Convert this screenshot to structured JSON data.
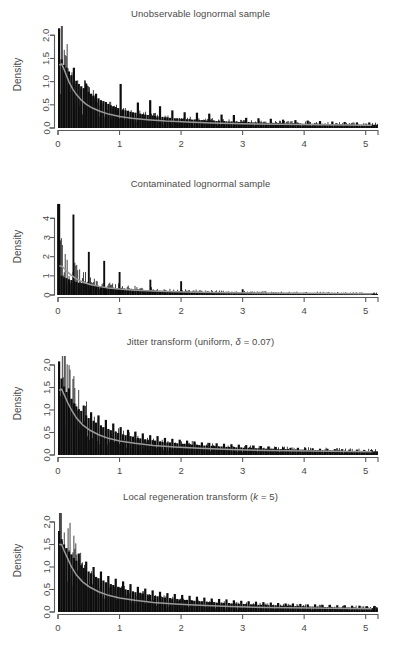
{
  "figure": {
    "width": 401,
    "height": 650,
    "background": "#ffffff",
    "axis_color": "#5a5a5a",
    "hist_color": "#0d0d0d",
    "density_color": "#9a9a9a",
    "text_color": "#494949"
  },
  "chart_data": [
    {
      "type": "bar",
      "title": "Unobservable lognormal sample",
      "xlabel": "",
      "ylabel": "Density",
      "xlim": [
        0,
        5.2
      ],
      "ylim": [
        0,
        2.2
      ],
      "xticks": [
        0,
        1,
        2,
        3,
        4,
        5
      ],
      "xticklabels": [
        "0",
        "1",
        "2",
        "3",
        "4",
        "5"
      ],
      "yticks": [
        0.0,
        0.5,
        1.0,
        1.5,
        2.0
      ],
      "yticklabels": [
        "0.0",
        "0.5",
        "1.0",
        "1.5",
        "2.0"
      ],
      "grid": false,
      "legend": "none",
      "bin_width": 0.04,
      "values": [
        2.15,
        1.48,
        1.36,
        1.3,
        1.22,
        1.14,
        1.3,
        1.02,
        0.95,
        0.9,
        0.86,
        0.96,
        0.78,
        0.74,
        0.7,
        0.74,
        0.64,
        0.6,
        0.58,
        0.56,
        0.52,
        0.49,
        0.47,
        0.45,
        0.43,
        0.95,
        0.4,
        0.38,
        0.37,
        0.35,
        0.34,
        0.33,
        0.55,
        0.31,
        0.3,
        0.29,
        0.28,
        0.6,
        0.27,
        0.26,
        0.25,
        0.47,
        0.24,
        0.23,
        0.23,
        0.22,
        0.38,
        0.21,
        0.21,
        0.2,
        0.2,
        0.34,
        0.19,
        0.19,
        0.18,
        0.18,
        0.33,
        0.17,
        0.17,
        0.17,
        0.16,
        0.31,
        0.16,
        0.16,
        0.15,
        0.15,
        0.29,
        0.15,
        0.14,
        0.14,
        0.14,
        0.28,
        0.14,
        0.13,
        0.13,
        0.13,
        0.22,
        0.13,
        0.12,
        0.12,
        0.12,
        0.21,
        0.12,
        0.12,
        0.11,
        0.11,
        0.2,
        0.11,
        0.11,
        0.11,
        0.11,
        0.18,
        0.1,
        0.1,
        0.1,
        0.1,
        0.17,
        0.1,
        0.1,
        0.09,
        0.09,
        0.16,
        0.09,
        0.09,
        0.09,
        0.09,
        0.15,
        0.09,
        0.09,
        0.08,
        0.08,
        0.14,
        0.08,
        0.08,
        0.08,
        0.08,
        0.13,
        0.08,
        0.08,
        0.08,
        0.07,
        0.12,
        0.07,
        0.07,
        0.07,
        0.07,
        0.12,
        0.07,
        0.07,
        0.07
      ],
      "density_curve": {
        "x": [
          0.02,
          0.06,
          0.1,
          0.14,
          0.18,
          0.24,
          0.3,
          0.38,
          0.46,
          0.56,
          0.68,
          0.82,
          1.0,
          1.2,
          1.45,
          1.75,
          2.1,
          2.5,
          3.0,
          3.6,
          4.3,
          5.1
        ],
        "y": [
          1.36,
          1.38,
          1.26,
          1.12,
          0.99,
          0.84,
          0.72,
          0.6,
          0.51,
          0.43,
          0.36,
          0.3,
          0.25,
          0.21,
          0.18,
          0.15,
          0.13,
          0.11,
          0.09,
          0.08,
          0.07,
          0.06
        ]
      }
    },
    {
      "type": "bar",
      "title": "Contaminated lognormal sample",
      "xlabel": "",
      "ylabel": "Density",
      "xlim": [
        0,
        5.2
      ],
      "ylim": [
        0,
        4.8
      ],
      "xticks": [
        0,
        1,
        2,
        3,
        4,
        5
      ],
      "xticklabels": [
        "0",
        "1",
        "2",
        "3",
        "4",
        "5"
      ],
      "yticks": [
        0,
        1,
        2,
        3,
        4
      ],
      "yticklabels": [
        "0",
        "1",
        "2",
        "3",
        "4"
      ],
      "grid": false,
      "legend": "none",
      "bin_width": 0.04,
      "contamination_spikes": [
        {
          "x": 0.0,
          "height": 4.75
        },
        {
          "x": 0.25,
          "height": 4.2
        },
        {
          "x": 0.5,
          "height": 2.25
        },
        {
          "x": 0.75,
          "height": 1.78
        },
        {
          "x": 1.0,
          "height": 1.2
        },
        {
          "x": 1.5,
          "height": 0.8
        },
        {
          "x": 2.0,
          "height": 0.72
        },
        {
          "x": 3.0,
          "height": 0.3
        }
      ],
      "values": [
        4.75,
        1.0,
        0.92,
        0.88,
        0.82,
        0.78,
        0.72,
        0.68,
        0.64,
        0.62,
        0.6,
        0.58,
        0.55,
        0.52,
        0.5,
        0.48,
        0.46,
        0.45,
        0.44,
        0.42,
        0.4,
        0.38,
        0.37,
        0.36,
        0.35,
        0.34,
        0.33,
        0.32,
        0.31,
        0.3,
        0.29,
        0.28,
        0.28,
        0.27,
        0.26,
        0.25,
        0.25,
        0.24,
        0.24,
        0.23,
        0.22,
        0.22,
        0.21,
        0.21,
        0.2,
        0.2,
        0.19,
        0.19,
        0.19,
        0.18,
        0.18,
        0.17,
        0.17,
        0.17,
        0.16,
        0.16,
        0.16,
        0.15,
        0.15,
        0.15,
        0.15,
        0.14,
        0.14,
        0.14,
        0.14,
        0.13,
        0.13,
        0.13,
        0.13,
        0.12,
        0.12,
        0.12,
        0.12,
        0.12,
        0.11,
        0.11,
        0.11,
        0.11,
        0.11,
        0.1,
        0.1,
        0.1,
        0.1,
        0.1,
        0.1,
        0.09,
        0.09,
        0.09,
        0.09,
        0.09,
        0.09,
        0.09,
        0.08,
        0.08,
        0.08,
        0.08,
        0.08,
        0.08,
        0.08,
        0.08,
        0.07,
        0.07,
        0.07,
        0.07,
        0.07,
        0.07,
        0.07,
        0.07,
        0.07,
        0.06,
        0.06,
        0.06,
        0.06,
        0.06,
        0.06,
        0.06,
        0.06,
        0.06,
        0.06,
        0.06,
        0.05,
        0.05,
        0.05,
        0.05,
        0.05,
        0.05,
        0.05,
        0.05,
        0.05,
        0.05
      ],
      "density_curve": {
        "x": [
          0.02,
          0.06,
          0.1,
          0.16,
          0.22,
          0.3,
          0.4,
          0.52,
          0.66,
          0.82,
          1.0,
          1.25,
          1.55,
          1.9,
          2.3,
          2.8,
          3.4,
          4.1,
          5.1
        ],
        "y": [
          1.52,
          1.5,
          1.38,
          1.2,
          1.02,
          0.84,
          0.68,
          0.55,
          0.45,
          0.37,
          0.31,
          0.25,
          0.21,
          0.17,
          0.15,
          0.12,
          0.1,
          0.09,
          0.07
        ]
      }
    },
    {
      "type": "bar",
      "title": "Jitter transform (uniform, δ = 0.07)",
      "title_parts": {
        "prefix": "Jitter transform (uniform, ",
        "symbol": "δ",
        "suffix": " = 0.07)"
      },
      "xlabel": "",
      "ylabel": "Density",
      "xlim": [
        0,
        5.2
      ],
      "ylim": [
        0,
        2.2
      ],
      "xticks": [
        0,
        1,
        2,
        3,
        4,
        5
      ],
      "xticklabels": [
        "0",
        "1",
        "2",
        "3",
        "4",
        "5"
      ],
      "yticks": [
        0.0,
        0.5,
        1.0,
        1.5,
        2.0
      ],
      "yticklabels": [
        "0.0",
        "0.5",
        "1.0",
        "1.5",
        "2.0"
      ],
      "grid": false,
      "legend": "none",
      "bin_width": 0.04,
      "values": [
        2.08,
        1.7,
        1.52,
        1.4,
        1.48,
        1.25,
        1.15,
        1.08,
        1.02,
        0.98,
        1.1,
        0.88,
        0.82,
        0.95,
        0.76,
        0.72,
        0.88,
        0.66,
        0.62,
        0.78,
        0.58,
        0.55,
        0.7,
        0.52,
        0.49,
        0.62,
        0.46,
        0.44,
        0.56,
        0.42,
        0.4,
        0.52,
        0.38,
        0.37,
        0.48,
        0.35,
        0.34,
        0.44,
        0.33,
        0.32,
        0.42,
        0.3,
        0.29,
        0.38,
        0.28,
        0.28,
        0.36,
        0.27,
        0.26,
        0.34,
        0.25,
        0.25,
        0.32,
        0.24,
        0.23,
        0.3,
        0.23,
        0.22,
        0.28,
        0.21,
        0.21,
        0.27,
        0.2,
        0.2,
        0.26,
        0.19,
        0.19,
        0.25,
        0.18,
        0.18,
        0.24,
        0.18,
        0.17,
        0.23,
        0.17,
        0.16,
        0.22,
        0.16,
        0.16,
        0.21,
        0.15,
        0.15,
        0.2,
        0.15,
        0.14,
        0.19,
        0.14,
        0.14,
        0.18,
        0.13,
        0.13,
        0.17,
        0.13,
        0.13,
        0.16,
        0.12,
        0.12,
        0.16,
        0.12,
        0.12,
        0.15,
        0.11,
        0.11,
        0.15,
        0.11,
        0.11,
        0.14,
        0.11,
        0.1,
        0.14,
        0.1,
        0.1,
        0.13,
        0.1,
        0.1,
        0.13,
        0.09,
        0.09,
        0.12,
        0.09,
        0.09,
        0.12,
        0.09,
        0.09,
        0.11,
        0.08,
        0.08,
        0.11,
        0.08,
        0.08
      ],
      "density_curve": {
        "x": [
          0.02,
          0.06,
          0.1,
          0.16,
          0.22,
          0.3,
          0.4,
          0.52,
          0.66,
          0.82,
          1.0,
          1.25,
          1.55,
          1.9,
          2.3,
          2.8,
          3.4,
          4.1,
          5.1
        ],
        "y": [
          1.44,
          1.46,
          1.34,
          1.16,
          1.0,
          0.82,
          0.67,
          0.55,
          0.45,
          0.37,
          0.31,
          0.26,
          0.21,
          0.18,
          0.15,
          0.12,
          0.1,
          0.09,
          0.07
        ]
      }
    },
    {
      "type": "bar",
      "title": "Local regeneration transform (k = 5)",
      "title_parts": {
        "prefix": "Local regeneration transform (",
        "symbol": "k",
        "suffix": " = 5)"
      },
      "xlabel": "",
      "ylabel": "Density",
      "xlim": [
        0,
        5.2
      ],
      "ylim": [
        0,
        2.2
      ],
      "xticks": [
        0,
        1,
        2,
        3,
        4,
        5
      ],
      "xticklabels": [
        "0",
        "1",
        "2",
        "3",
        "4",
        "5"
      ],
      "yticks": [
        0.0,
        0.5,
        1.0,
        1.5,
        2.0
      ],
      "yticklabels": [
        "0.0",
        "0.5",
        "1.0",
        "1.5",
        "2.0"
      ],
      "grid": false,
      "legend": "none",
      "bin_width": 0.04,
      "values": [
        1.8,
        1.62,
        1.5,
        1.42,
        1.34,
        1.28,
        1.2,
        1.14,
        1.3,
        1.04,
        0.98,
        1.12,
        0.9,
        0.86,
        1.0,
        0.78,
        0.75,
        0.9,
        0.7,
        0.66,
        0.8,
        0.62,
        0.6,
        0.74,
        0.56,
        0.54,
        0.68,
        0.5,
        0.49,
        0.62,
        0.46,
        0.44,
        0.56,
        0.42,
        0.41,
        0.52,
        0.39,
        0.38,
        0.48,
        0.36,
        0.35,
        0.45,
        0.33,
        0.32,
        0.42,
        0.31,
        0.3,
        0.4,
        0.29,
        0.28,
        0.38,
        0.27,
        0.27,
        0.36,
        0.26,
        0.25,
        0.34,
        0.24,
        0.24,
        0.32,
        0.23,
        0.22,
        0.3,
        0.22,
        0.21,
        0.29,
        0.21,
        0.2,
        0.28,
        0.2,
        0.19,
        0.26,
        0.19,
        0.18,
        0.25,
        0.18,
        0.18,
        0.24,
        0.17,
        0.17,
        0.23,
        0.16,
        0.16,
        0.22,
        0.16,
        0.15,
        0.21,
        0.15,
        0.15,
        0.2,
        0.14,
        0.14,
        0.19,
        0.14,
        0.14,
        0.19,
        0.13,
        0.13,
        0.18,
        0.13,
        0.12,
        0.17,
        0.12,
        0.12,
        0.17,
        0.12,
        0.11,
        0.16,
        0.11,
        0.11,
        0.16,
        0.11,
        0.1,
        0.15,
        0.1,
        0.1,
        0.15,
        0.1,
        0.1,
        0.14,
        0.09,
        0.09,
        0.14,
        0.09,
        0.09,
        0.13,
        0.09,
        0.09,
        0.13,
        0.08
      ],
      "density_curve": {
        "x": [
          0.02,
          0.06,
          0.1,
          0.16,
          0.22,
          0.3,
          0.4,
          0.52,
          0.66,
          0.82,
          1.0,
          1.25,
          1.55,
          1.9,
          2.3,
          2.8,
          3.4,
          4.1,
          5.1
        ],
        "y": [
          1.5,
          1.5,
          1.36,
          1.18,
          1.0,
          0.82,
          0.67,
          0.55,
          0.45,
          0.37,
          0.31,
          0.26,
          0.21,
          0.18,
          0.15,
          0.12,
          0.1,
          0.09,
          0.07
        ]
      }
    }
  ]
}
